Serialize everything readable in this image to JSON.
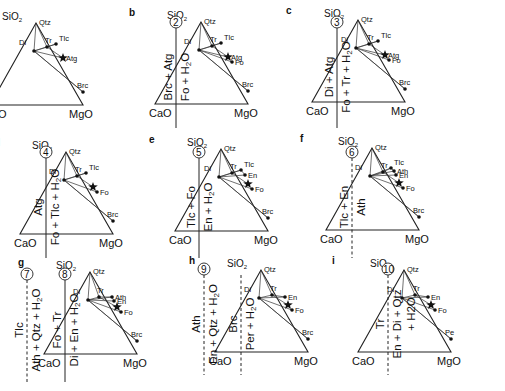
{
  "figure": {
    "panels": [
      {
        "id": "a",
        "ox": 82,
        "oy": 33,
        "w": 98,
        "h": 88,
        "labels": {
          "top": "SiO",
          "top_sub": "2",
          "qtz": "Qtz",
          "left": "CaO",
          "right": "MgO"
        },
        "phases": [
          {
            "name": "Di",
            "x": -2,
            "y": 40
          },
          {
            "name": "Tr",
            "x": 11,
            "y": 36
          },
          {
            "name": "Tlc",
            "x": 20,
            "y": 33
          },
          {
            "name": "Atg",
            "x": 27,
            "y": 47,
            "star": true
          },
          {
            "name": "Brc",
            "x": 47,
            "y": 81
          }
        ]
      },
      {
        "id": "b",
        "ox": 247,
        "oy": 32,
        "w": 98,
        "h": 88,
        "labels": {
          "top": "SiO",
          "top_sub": "2",
          "qtz": "Qtz",
          "left": "CaO",
          "right": "MgO"
        },
        "phases": [
          {
            "name": "Di",
            "x": -2,
            "y": 40
          },
          {
            "name": "Tr",
            "x": 11,
            "y": 36
          },
          {
            "name": "Tlc",
            "x": 20,
            "y": 33
          },
          {
            "name": "Atg",
            "x": 27,
            "y": 47,
            "star": true
          },
          {
            "name": "Fo",
            "x": 31,
            "y": 52
          },
          {
            "name": "Brc",
            "x": 47,
            "y": 81
          }
        ]
      },
      {
        "id": "c",
        "ox": 404,
        "oy": 30,
        "w": 98,
        "h": 88,
        "labels": {
          "top": "SiO",
          "top_sub": "2",
          "qtz": "Qtz",
          "left": "CaO",
          "right": "MgO"
        },
        "phases": [
          {
            "name": "Di",
            "x": -2,
            "y": 40
          },
          {
            "name": "Tr",
            "x": 11,
            "y": 36
          },
          {
            "name": "Tlc",
            "x": 20,
            "y": 33
          },
          {
            "name": "Atg",
            "x": 27,
            "y": 47,
            "star": true
          },
          {
            "name": "Fo",
            "x": 31,
            "y": 52
          },
          {
            "name": "Brc",
            "x": 47,
            "y": 81
          }
        ]
      },
      {
        "id": "d",
        "ox": 112,
        "oy": 162,
        "w": 98,
        "h": 88,
        "labels": {
          "top": "SiO",
          "top_sub": "2",
          "qtz": "Qtz",
          "left": "CaO",
          "right": "MgO"
        },
        "phases": [
          {
            "name": "Di",
            "x": -2,
            "y": 40
          },
          {
            "name": "Tr",
            "x": 11,
            "y": 36
          },
          {
            "name": "Tlc",
            "x": 20,
            "y": 33
          },
          {
            "name": "Fo",
            "x": 31,
            "y": 52
          },
          {
            "name": "Brc",
            "x": 47,
            "y": 81
          }
        ],
        "star": {
          "x": 27,
          "y": 47
        }
      },
      {
        "id": "e",
        "ox": 267,
        "oy": 159,
        "w": 98,
        "h": 88,
        "labels": {
          "top": "SiO",
          "top_sub": "2",
          "qtz": "Qtz",
          "left": "CaO",
          "right": "MgO"
        },
        "phases": [
          {
            "name": "Di",
            "x": -2,
            "y": 40
          },
          {
            "name": "Tr",
            "x": 11,
            "y": 36
          },
          {
            "name": "Tlc",
            "x": 20,
            "y": 33
          },
          {
            "name": "En",
            "x": 24,
            "y": 38
          },
          {
            "name": "Fo",
            "x": 31,
            "y": 52
          },
          {
            "name": "Brc",
            "x": 47,
            "y": 81
          }
        ],
        "star": {
          "x": 27,
          "y": 47
        }
      },
      {
        "id": "f",
        "ox": 418,
        "oy": 158,
        "w": 98,
        "h": 88,
        "labels": {
          "top": "SiO",
          "top_sub": "2",
          "qtz": "Qtz",
          "left": "CaO",
          "right": "MgO"
        },
        "phases": [
          {
            "name": "Di",
            "x": -2,
            "y": 40
          },
          {
            "name": "Tr",
            "x": 11,
            "y": 36
          },
          {
            "name": "Tlc",
            "x": 19,
            "y": 32
          },
          {
            "name": "Ath",
            "x": 22,
            "y": 35
          },
          {
            "name": "En",
            "x": 24,
            "y": 39
          },
          {
            "name": "Fo",
            "x": 31,
            "y": 52
          },
          {
            "name": "Brc",
            "x": 47,
            "y": 81
          }
        ],
        "star": {
          "x": 27,
          "y": 47
        }
      },
      {
        "id": "g",
        "ox": 136,
        "oy": 282,
        "w": 98,
        "h": 88,
        "labels": {
          "top": "SiO",
          "top_sub": "2",
          "qtz": "Qtz",
          "left": "CaO",
          "right": "MgO"
        },
        "phases": [
          {
            "name": "Di",
            "x": -2,
            "y": 40
          },
          {
            "name": "Tr",
            "x": 9,
            "y": 37
          },
          {
            "name": "Ath",
            "x": 22,
            "y": 37
          },
          {
            "name": "En",
            "x": 24,
            "y": 41
          },
          {
            "name": "Fo",
            "x": 31,
            "y": 52
          },
          {
            "name": "Brc",
            "x": 47,
            "y": 81
          }
        ],
        "star": {
          "x": 27,
          "y": 47
        }
      },
      {
        "id": "h",
        "ox": 307,
        "oy": 280,
        "w": 98,
        "h": 88,
        "labels": {
          "top": "SiO",
          "top_sub": "2",
          "qtz": "Qtz",
          "left": "CaO",
          "right": "MgO"
        },
        "phases": [
          {
            "name": "Di",
            "x": -2,
            "y": 40
          },
          {
            "name": "Tr",
            "x": 11,
            "y": 37
          },
          {
            "name": "En",
            "x": 24,
            "y": 39
          },
          {
            "name": "Fo",
            "x": 31,
            "y": 52
          },
          {
            "name": "Brc",
            "x": 47,
            "y": 81
          }
        ],
        "star": {
          "x": 27,
          "y": 47
        }
      },
      {
        "id": "i",
        "ox": 450,
        "oy": 280,
        "w": 98,
        "h": 88,
        "labels": {
          "top": "SiO",
          "top_sub": "2",
          "qtz": "Qtz",
          "left": "CaO",
          "right": "MgO"
        },
        "phases": [
          {
            "name": "Di",
            "x": -2,
            "y": 40
          },
          {
            "name": "Tr",
            "x": 11,
            "y": 37
          },
          {
            "name": "En",
            "x": 24,
            "y": 39
          },
          {
            "name": "Fo",
            "x": 31,
            "y": 52
          },
          {
            "name": "Pe",
            "x": 47,
            "y": 81
          }
        ],
        "star": {
          "x": 27,
          "y": 47
        }
      }
    ],
    "reactions": [
      {
        "num": "2",
        "x": 176,
        "y1": 18,
        "y2": 128,
        "dashed": false,
        "reactants": "Brc + Atg",
        "products": "Fo + H",
        "products_sub": "2",
        "products_tail": "O"
      },
      {
        "num": "3",
        "x": 337,
        "y1": 18,
        "y2": 128,
        "dashed": false,
        "reactants": "Di + Atg",
        "products": "Fo + Tr + H",
        "products_sub": "2",
        "products_tail": "O"
      },
      {
        "num": "4",
        "x": 46,
        "y1": 148,
        "y2": 258,
        "dashed": false,
        "reactants": "Atg",
        "products": "Fo + Tlc + H",
        "products_sub": "2",
        "products_tail": "O"
      },
      {
        "num": "5",
        "x": 199,
        "y1": 148,
        "y2": 258,
        "dashed": false,
        "reactants": "Tlc + Fo",
        "products": "En + H",
        "products_sub": "2",
        "products_tail": "O"
      },
      {
        "num": "6",
        "x": 352,
        "y1": 148,
        "y2": 258,
        "dashed": true,
        "reactants": "Tlc + En",
        "products": "Ath",
        "products_sub": "",
        "products_tail": ""
      },
      {
        "num": "7",
        "x": 27,
        "y1": 270,
        "y2": 382,
        "dashed": true,
        "reactants": "Tlc",
        "products": "Ath + Qtz + H",
        "products_sub": "2",
        "products_tail": "O"
      },
      {
        "num": "8",
        "x": 65,
        "y1": 270,
        "y2": 382,
        "dashed": false,
        "reactants": "Fo + Tr",
        "products": "Di + En + H",
        "products_sub": "2",
        "products_tail": "O"
      },
      {
        "num": "9",
        "x": 204,
        "y1": 265,
        "y2": 375,
        "dashed": true,
        "reactants": "Ath",
        "products": "En + Qtz + H",
        "products_sub": "2",
        "products_tail": "O"
      },
      {
        "num": "",
        "x": 241,
        "y1": 265,
        "y2": 375,
        "dashed": true,
        "reactants": "Brc",
        "products": "Per + H",
        "products_sub": "2",
        "products_tail": "O"
      },
      {
        "num": "10",
        "x": 388,
        "y1": 265,
        "y2": 375,
        "dashed": true,
        "reactants": "Tr",
        "products": "En + Di + Qtz",
        "products_sub": "",
        "products_tail": "",
        "products_line2": "+ H2O"
      }
    ]
  }
}
